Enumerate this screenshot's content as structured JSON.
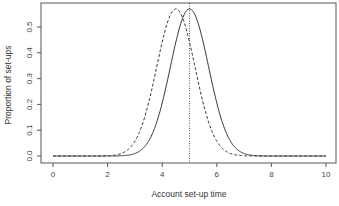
{
  "chart_data": {
    "type": "line",
    "title": "",
    "xlabel": "Account set-up time",
    "ylabel": "Proportion of set-ups",
    "xlim": [
      0,
      10
    ],
    "ylim": [
      0,
      0.57
    ],
    "x_ticks": [
      0,
      2,
      4,
      6,
      8,
      10
    ],
    "x_tick_labels": [
      "0",
      "2",
      "4",
      "6",
      "8",
      "10"
    ],
    "y_ticks": [
      0.0,
      0.1,
      0.2,
      0.3,
      0.4,
      0.5
    ],
    "y_tick_labels": [
      "0.0",
      "0.1",
      "0.2",
      "0.3",
      "0.4",
      "0.5"
    ],
    "grid": false,
    "legend": null,
    "series": [
      {
        "name": "solid",
        "line_style": "solid",
        "distribution": "normal",
        "mean": 5.0,
        "sd": 0.7,
        "peak_y": 0.57,
        "color": "#333333"
      },
      {
        "name": "dashed",
        "line_style": "dashed",
        "distribution": "normal",
        "mean": 4.5,
        "sd": 0.7,
        "peak_y": 0.57,
        "color": "#333333"
      }
    ],
    "annotations": [
      {
        "type": "vline",
        "x": 5.0,
        "line_style": "dotted",
        "color": "#333333"
      }
    ]
  }
}
